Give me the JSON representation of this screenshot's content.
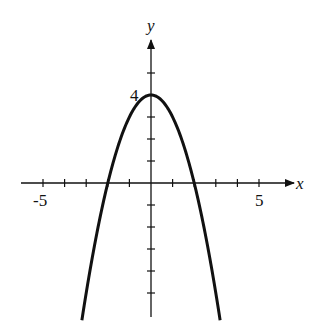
{
  "chart_data": {
    "type": "line",
    "title": "",
    "function": "y = 4 - x^2",
    "xlabel": "x",
    "ylabel": "y",
    "xlim": [
      -6,
      6.5
    ],
    "ylim": [
      -6.3,
      6.3
    ],
    "grid": false,
    "legend": null,
    "x_ticks": [
      -5,
      -4,
      -3,
      -2,
      -1,
      1,
      2,
      3,
      4,
      5
    ],
    "y_ticks": [
      -5,
      -4,
      -3,
      -2,
      -1,
      1,
      2,
      3,
      4,
      5
    ],
    "tick_labels": {
      "x": [
        {
          "value": -5,
          "label": "-5"
        },
        {
          "value": 5,
          "label": "5"
        }
      ],
      "y": [
        {
          "value": 4,
          "label": "4"
        }
      ]
    },
    "series": [
      {
        "name": "y = 4 - x^2",
        "x": [
          -3.2,
          -3,
          -2.5,
          -2,
          -1.5,
          -1,
          -0.5,
          0,
          0.5,
          1,
          1.5,
          2,
          2.5,
          3,
          3.2
        ],
        "y": [
          -6.24,
          -5,
          -2.25,
          0,
          1.75,
          3,
          3.75,
          4,
          3.75,
          3,
          1.75,
          0,
          -2.25,
          -5,
          -6.24
        ]
      }
    ],
    "annotations": [
      {
        "text": "4",
        "at": [
          0,
          4
        ],
        "note": "vertex / y-intercept label"
      }
    ],
    "colors": {
      "axis": "#111111",
      "curve": "#111111"
    }
  }
}
